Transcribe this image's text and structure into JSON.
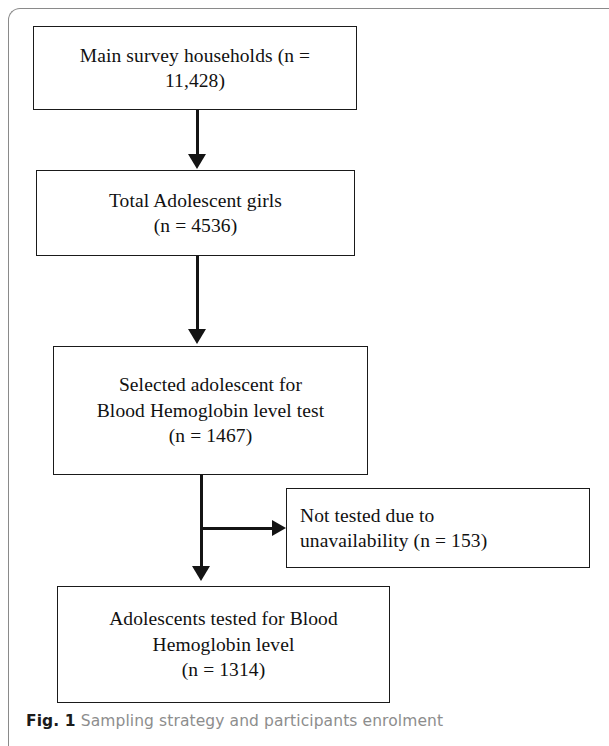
{
  "figure": {
    "caption_label": "Fig. 1",
    "caption_text": "Sampling strategy and participants enrolment"
  },
  "colors": {
    "box_border": "#1a1a1a",
    "connector": "#141414",
    "frame": "#8a8a8a",
    "caption_label": "#1b1b1b",
    "caption_text": "#8d8d8d",
    "background": "#ffffff"
  },
  "flowchart": {
    "type": "flowchart",
    "orientation": "top-to-bottom",
    "nodes": [
      {
        "id": "main-survey",
        "lines": [
          "Main survey households (n =",
          "11,428)"
        ],
        "label": "Main survey households",
        "n": 11428,
        "align": "center"
      },
      {
        "id": "total-girls",
        "lines": [
          "Total Adolescent girls",
          "(n = 4536)"
        ],
        "label": "Total Adolescent girls",
        "n": 4536,
        "align": "center"
      },
      {
        "id": "selected-adolescent",
        "lines": [
          "Selected adolescent for",
          "Blood Hemoglobin level test",
          "(n = 1467)"
        ],
        "label": "Selected adolescent for Blood Hemoglobin level test",
        "n": 1467,
        "align": "center"
      },
      {
        "id": "not-tested",
        "lines": [
          "Not tested due to",
          "unavailability (n = 153)"
        ],
        "label": "Not tested due to unavailability",
        "n": 153,
        "align": "left"
      },
      {
        "id": "adolescents-tested",
        "lines": [
          "Adolescents tested for Blood",
          "Hemoglobin level",
          "(n = 1314)"
        ],
        "label": "Adolescents tested for Blood Hemoglobin level",
        "n": 1314,
        "align": "center"
      }
    ],
    "edges": [
      {
        "from": "main-survey",
        "to": "total-girls",
        "direction": "down"
      },
      {
        "from": "total-girls",
        "to": "selected-adolescent",
        "direction": "down"
      },
      {
        "from": "selected-adolescent",
        "to": "adolescents-tested",
        "direction": "down"
      },
      {
        "from": "selected-adolescent",
        "to": "not-tested",
        "direction": "right"
      }
    ]
  }
}
